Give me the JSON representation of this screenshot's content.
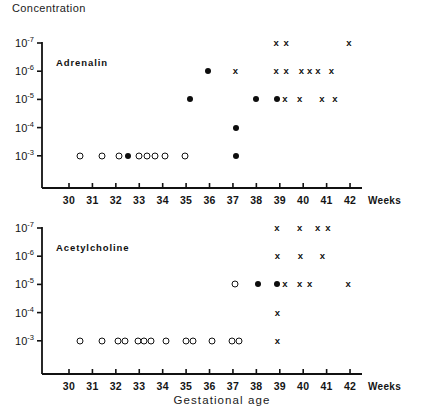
{
  "figure": {
    "y_axis_title": "Concentration",
    "x_axis_title": "Gestational  age",
    "x_unit_label": "Weeks"
  },
  "axes": {
    "y_tick_labels": [
      "10-7",
      "10-6",
      "10-5",
      "10-4",
      "10-3"
    ],
    "y_tick_bases": [
      "10",
      "10",
      "10",
      "10",
      "10"
    ],
    "y_tick_exponents": [
      "-7",
      "-6",
      "-5",
      "-4",
      "-3"
    ],
    "x_tick_labels": [
      "30",
      "31",
      "32",
      "33",
      "34",
      "35",
      "36",
      "37",
      "38",
      "39",
      "40",
      "41",
      "42"
    ]
  },
  "panels": [
    {
      "id": "adrenalin",
      "label": "Adrenalin"
    },
    {
      "id": "acetylcholine",
      "label": "Acetylcholine"
    }
  ],
  "chart_data": {
    "type": "scatter",
    "title": "",
    "xlabel": "Gestational age",
    "ylabel": "Concentration",
    "xlim": [
      29.3,
      42.6
    ],
    "ylim_log_exponents": [
      -3,
      -7
    ],
    "x_ticks": [
      30,
      31,
      32,
      33,
      34,
      35,
      36,
      37,
      38,
      39,
      40,
      41,
      42
    ],
    "y_ticks": [
      "1e-3",
      "1e-4",
      "1e-5",
      "1e-6",
      "1e-7"
    ],
    "grid": false,
    "legend": "none",
    "marker_meanings": {
      "open-circle": "open circle marker",
      "filled-circle": "filled circle marker",
      "cross": "x marker"
    },
    "panels": [
      {
        "name": "Adrenalin",
        "series": [
          {
            "name": "open-circle",
            "points": [
              {
                "x": 30.45,
                "y": "1e-3"
              },
              {
                "x": 31.42,
                "y": "1e-3"
              },
              {
                "x": 32.15,
                "y": "1e-3"
              },
              {
                "x": 33.0,
                "y": "1e-3"
              },
              {
                "x": 33.35,
                "y": "1e-3"
              },
              {
                "x": 33.67,
                "y": "1e-3"
              },
              {
                "x": 34.1,
                "y": "1e-3"
              },
              {
                "x": 34.95,
                "y": "1e-3"
              }
            ]
          },
          {
            "name": "filled-circle",
            "points": [
              {
                "x": 32.5,
                "y": "1e-3"
              },
              {
                "x": 37.15,
                "y": "1e-3"
              },
              {
                "x": 37.15,
                "y": "1e-4"
              },
              {
                "x": 35.15,
                "y": "1e-5"
              },
              {
                "x": 38.0,
                "y": "1e-5"
              },
              {
                "x": 38.9,
                "y": "1e-5"
              },
              {
                "x": 35.95,
                "y": "1e-6"
              }
            ]
          },
          {
            "name": "cross",
            "points": [
              {
                "x": 39.22,
                "y": "1e-5"
              },
              {
                "x": 39.85,
                "y": "1e-5"
              },
              {
                "x": 40.8,
                "y": "1e-5"
              },
              {
                "x": 41.35,
                "y": "1e-5"
              },
              {
                "x": 37.1,
                "y": "1e-6"
              },
              {
                "x": 38.85,
                "y": "1e-6"
              },
              {
                "x": 39.27,
                "y": "1e-6"
              },
              {
                "x": 39.92,
                "y": "1e-6"
              },
              {
                "x": 40.28,
                "y": "1e-6"
              },
              {
                "x": 40.63,
                "y": "1e-6"
              },
              {
                "x": 41.2,
                "y": "1e-6"
              },
              {
                "x": 38.85,
                "y": "1e-7"
              },
              {
                "x": 39.27,
                "y": "1e-7"
              },
              {
                "x": 41.95,
                "y": "1e-7"
              }
            ]
          }
        ]
      },
      {
        "name": "Acetylcholine",
        "series": [
          {
            "name": "open-circle",
            "points": [
              {
                "x": 30.45,
                "y": "1e-3"
              },
              {
                "x": 31.4,
                "y": "1e-3"
              },
              {
                "x": 32.1,
                "y": "1e-3"
              },
              {
                "x": 32.4,
                "y": "1e-3"
              },
              {
                "x": 32.95,
                "y": "1e-3"
              },
              {
                "x": 33.22,
                "y": "1e-3"
              },
              {
                "x": 33.5,
                "y": "1e-3"
              },
              {
                "x": 34.15,
                "y": "1e-3"
              },
              {
                "x": 35.0,
                "y": "1e-3"
              },
              {
                "x": 35.28,
                "y": "1e-3"
              },
              {
                "x": 36.1,
                "y": "1e-3"
              },
              {
                "x": 36.95,
                "y": "1e-3"
              },
              {
                "x": 37.25,
                "y": "1e-3"
              },
              {
                "x": 37.08,
                "y": "1e-5"
              }
            ]
          },
          {
            "name": "filled-circle",
            "points": [
              {
                "x": 38.05,
                "y": "1e-5"
              },
              {
                "x": 38.88,
                "y": "1e-5"
              }
            ]
          },
          {
            "name": "cross",
            "points": [
              {
                "x": 38.9,
                "y": "1e-3"
              },
              {
                "x": 38.9,
                "y": "1e-4"
              },
              {
                "x": 39.22,
                "y": "1e-5"
              },
              {
                "x": 39.85,
                "y": "1e-5"
              },
              {
                "x": 40.28,
                "y": "1e-5"
              },
              {
                "x": 41.92,
                "y": "1e-5"
              },
              {
                "x": 38.9,
                "y": "1e-6"
              },
              {
                "x": 39.88,
                "y": "1e-6"
              },
              {
                "x": 40.82,
                "y": "1e-6"
              },
              {
                "x": 38.88,
                "y": "1e-7"
              },
              {
                "x": 39.85,
                "y": "1e-7"
              },
              {
                "x": 40.62,
                "y": "1e-7"
              },
              {
                "x": 41.05,
                "y": "1e-7"
              }
            ]
          }
        ]
      }
    ]
  }
}
